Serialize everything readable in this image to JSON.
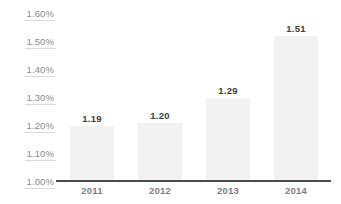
{
  "chart_data": {
    "type": "bar",
    "title": "",
    "subtitle": "",
    "xlabel": "",
    "ylabel": "",
    "categories": [
      "2011",
      "2012",
      "2013",
      "2014"
    ],
    "values": [
      1.19,
      1.2,
      1.29,
      1.51
    ],
    "data_labels": [
      "1.19",
      "1.20",
      "1.29",
      "1.51"
    ],
    "ylim": [
      1.0,
      1.6
    ],
    "ytick_values": [
      1.6,
      1.5,
      1.4,
      1.3,
      1.2,
      1.1,
      1.0
    ],
    "ytick_labels": [
      "1.60%",
      "1.50%",
      "1.40%",
      "1.30%",
      "1.20%",
      "1.10%",
      "1.00%"
    ],
    "grid": "y-tick-underline-only",
    "legend": "none",
    "series": [
      {
        "name": "",
        "values": [
          1.19,
          1.2,
          1.29,
          1.51
        ]
      }
    ],
    "colors": {
      "bar_fill": "#f2f2f2",
      "axis_line": "#4a4a4a",
      "gridline": "#d9d9d9",
      "ytick_text": "#8a8a8a",
      "xtick_text": "#7d7d7d",
      "value_label_text": "#3d3d3d",
      "background": "#ffffff"
    }
  }
}
